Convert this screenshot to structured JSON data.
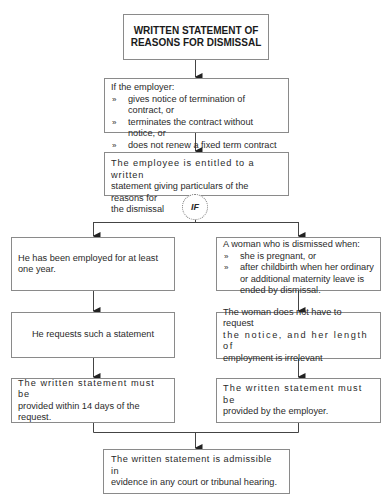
{
  "diagram": {
    "title_box": {
      "line1": "WRITTEN STATEMENT OF",
      "line2": "REASONS FOR DISMISSAL"
    },
    "conditions_box": {
      "intro": "If the employer:",
      "bullet_mark": "»",
      "items": [
        "gives notice of termination of contract, or",
        "terminates the contract without notice, or",
        "does not renew a fixed term contract"
      ]
    },
    "entitlement_box": {
      "line1": "The employee is entitled to a written",
      "line2": "statement giving particulars of the reasons for",
      "line3": "the dismissal"
    },
    "if_label": "IF",
    "left_branch": {
      "condition": "He has been employed for at least one year.",
      "request": "He requests such a statement",
      "deadline_line1": "The written statement must be",
      "deadline_line2": "provided within 14 days of the request."
    },
    "right_branch": {
      "intro": "A woman who is dismissed when:",
      "bullet_mark": "»",
      "items": [
        "she is pregnant, or",
        "after childbirth when her ordinary or additional maternity leave is ended by dismissal."
      ],
      "request_line1": "The woman does not have to request",
      "request_line2": "the notice, and her length of",
      "request_line3": "employment is irrelevant",
      "provider_line1": "The written statement must be",
      "provider_line2": "provided by the employer."
    },
    "final_box": {
      "line1": "The written statement is admissible in",
      "line2": "evidence in any court or tribunal hearing."
    },
    "colors": {
      "border": "#8a8a8a",
      "line": "#444444",
      "text": "#2a2a2a"
    }
  }
}
